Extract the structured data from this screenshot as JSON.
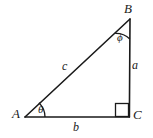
{
  "figure": {
    "type": "right-triangle-geometry-diagram",
    "background_color": "#ffffff",
    "stroke_color": "#1a1a1a",
    "width": 153,
    "height": 138,
    "vertices": [
      {
        "name": "A",
        "label": "A",
        "x": 25,
        "y": 117
      },
      {
        "name": "B",
        "label": "B",
        "x": 130,
        "y": 19
      },
      {
        "name": "C",
        "label": "C",
        "x": 129,
        "y": 117
      }
    ],
    "sides": [
      {
        "name": "hypotenuse",
        "label": "c",
        "from": "A",
        "to": "B"
      },
      {
        "name": "opposite",
        "label": "a",
        "from": "B",
        "to": "C"
      },
      {
        "name": "adjacent",
        "label": "b",
        "from": "A",
        "to": "C"
      }
    ],
    "angles": [
      {
        "name": "angle-at-A",
        "label": "θ",
        "vertex": "A",
        "marker": "arc"
      },
      {
        "name": "angle-at-B",
        "label": "ϕ",
        "vertex": "B",
        "marker": "arc"
      },
      {
        "name": "angle-at-C",
        "label": "",
        "vertex": "C",
        "marker": "right-angle-square"
      }
    ]
  }
}
